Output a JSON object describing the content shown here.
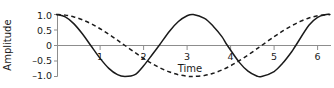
{
  "chart_data": {
    "type": "line",
    "title": "",
    "xlabel": "Time",
    "ylabel": "Amplitude",
    "xlim": [
      0,
      6.4
    ],
    "ylim": [
      -1.15,
      1.15
    ],
    "grid": false,
    "legend": "none",
    "x_ticks": [
      {
        "value": 1,
        "label": "1"
      },
      {
        "value": 2,
        "label": "2"
      },
      {
        "value": 3,
        "label": "3"
      },
      {
        "value": 4,
        "label": "4"
      },
      {
        "value": 5,
        "label": "5"
      },
      {
        "value": 6,
        "label": "6"
      }
    ],
    "y_ticks": [
      {
        "value": 1.0,
        "label": "1.0"
      },
      {
        "value": 0.5,
        "label": "0.5"
      },
      {
        "value": 0.0,
        "label": "0"
      },
      {
        "value": -0.5,
        "label": "–0.5"
      },
      {
        "value": -1.0,
        "label": "–1.0"
      }
    ],
    "series": [
      {
        "name": "high-frequency-wave",
        "style": "solid",
        "color": "#1a1a1a",
        "function": "cos(2t)",
        "amplitude": 1.0,
        "period": 3.1416,
        "x": [
          0.0,
          0.2,
          0.4,
          0.6,
          0.785,
          1.0,
          1.2,
          1.4,
          1.571,
          1.8,
          2.0,
          2.2,
          2.356,
          2.6,
          2.8,
          3.0,
          3.1416,
          3.4,
          3.6,
          3.8,
          3.927,
          4.2,
          4.4,
          4.6,
          4.712,
          5.0,
          5.2,
          5.4,
          5.498,
          5.8,
          6.0,
          6.2,
          6.283
        ],
        "y": [
          1.0,
          0.921,
          0.697,
          0.362,
          0.0,
          -0.416,
          -0.737,
          -0.942,
          -1.0,
          -0.942,
          -0.654,
          -0.292,
          0.0,
          0.469,
          0.773,
          0.96,
          1.0,
          0.874,
          0.624,
          0.287,
          0.0,
          -0.544,
          -0.825,
          -0.983,
          -1.0,
          -0.839,
          -0.568,
          -0.21,
          0.0,
          0.651,
          0.907,
          0.997,
          1.0
        ]
      },
      {
        "name": "low-frequency-wave",
        "style": "dashed",
        "color": "#1a1a1a",
        "function": "cos(t)",
        "amplitude": 1.0,
        "period": 6.2832,
        "x": [
          0.0,
          0.2,
          0.4,
          0.6,
          0.8,
          1.0,
          1.2,
          1.4,
          1.571,
          1.8,
          2.0,
          2.2,
          2.4,
          2.6,
          2.8,
          3.0,
          3.1416,
          3.4,
          3.6,
          3.8,
          4.0,
          4.2,
          4.4,
          4.6,
          4.712,
          5.0,
          5.2,
          5.4,
          5.6,
          5.8,
          6.0,
          6.2,
          6.283
        ],
        "y": [
          1.0,
          0.98,
          0.921,
          0.825,
          0.697,
          0.54,
          0.362,
          0.17,
          0.0,
          -0.227,
          -0.416,
          -0.589,
          -0.737,
          -0.857,
          -0.942,
          -0.99,
          -1.0,
          -0.967,
          -0.897,
          -0.791,
          -0.654,
          -0.49,
          -0.307,
          -0.112,
          0.0,
          0.284,
          0.469,
          0.635,
          0.776,
          0.886,
          0.96,
          0.996,
          1.0
        ]
      }
    ]
  }
}
